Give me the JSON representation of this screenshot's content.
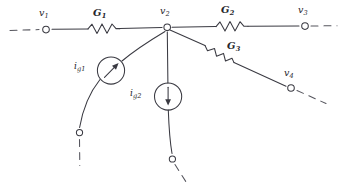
{
  "figure": {
    "type": "electrical-circuit-schematic",
    "title": "",
    "style": "hand-drawn textbook line art",
    "background_color": "#ffffff",
    "line_color": "#3a3a42"
  },
  "nodes": [
    {
      "id": "v1",
      "symbol": "v",
      "subscript": "1",
      "label": "v1",
      "x": 46,
      "y": 29,
      "terminal": "open-circle",
      "lead": "dashed-left"
    },
    {
      "id": "v2",
      "symbol": "v",
      "subscript": "2",
      "label": "v2",
      "x": 167,
      "y": 27,
      "terminal": "open-circle",
      "lead": "none"
    },
    {
      "id": "v3",
      "symbol": "v",
      "subscript": "3",
      "label": "v3",
      "x": 305,
      "y": 26,
      "terminal": "open-circle",
      "lead": "dashed-right"
    },
    {
      "id": "v4",
      "symbol": "v",
      "subscript": "4",
      "label": "v4",
      "x": 291,
      "y": 88,
      "terminal": "open-circle",
      "lead": "dashed-down-right"
    },
    {
      "id": "t1",
      "symbol": "",
      "subscript": "",
      "label": "",
      "x": 79,
      "y": 133,
      "terminal": "open-circle",
      "lead": "dashed-down"
    },
    {
      "id": "t2",
      "symbol": "",
      "subscript": "",
      "label": "",
      "x": 172,
      "y": 159,
      "terminal": "open-circle",
      "lead": "dashed-down-right"
    }
  ],
  "node_labels": {
    "v1": {
      "text": "v",
      "sub": "1"
    },
    "v2": {
      "text": "v",
      "sub": "2"
    },
    "v3": {
      "text": "v",
      "sub": "3"
    },
    "v4": {
      "text": "v",
      "sub": "4"
    }
  },
  "conductances": [
    {
      "id": "G1",
      "text": "G",
      "sub": "1",
      "between": [
        "v1",
        "v2"
      ],
      "orientation": "horizontal"
    },
    {
      "id": "G2",
      "text": "G",
      "sub": "2",
      "between": [
        "v2",
        "v3"
      ],
      "orientation": "horizontal"
    },
    {
      "id": "G3",
      "text": "G",
      "sub": "3",
      "between": [
        "v2",
        "v4"
      ],
      "orientation": "diagonal"
    }
  ],
  "sources": [
    {
      "id": "ig1",
      "text": "i",
      "sub": "g1",
      "kind": "current-source",
      "arrow": "diagonal-up-right",
      "branch": "v2-to-t1"
    },
    {
      "id": "ig2",
      "text": "i",
      "sub": "g2",
      "kind": "current-source",
      "arrow": "vertical-down",
      "branch": "v2-to-t2"
    }
  ]
}
